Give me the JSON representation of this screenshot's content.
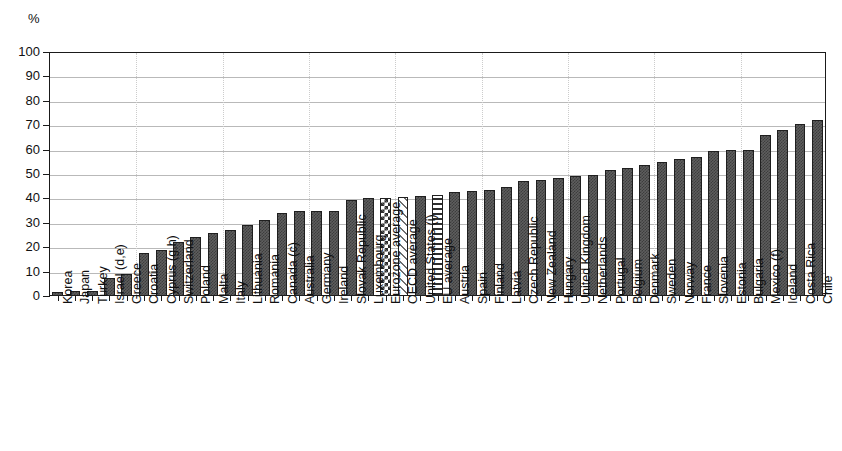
{
  "chart": {
    "unit_label": "%",
    "y_axis": {
      "ticks": [
        "0",
        "10",
        "20",
        "30",
        "40",
        "50",
        "60",
        "70",
        "80",
        "90",
        "100"
      ]
    }
  },
  "chart_data": {
    "type": "bar",
    "title": "",
    "subtitle": "",
    "xlabel": "",
    "ylabel": "%",
    "ylim": [
      0,
      100
    ],
    "ytick_step": 10,
    "grid": true,
    "legend": "none",
    "categories": [
      "Korea",
      "Japan",
      "Turkey",
      "Israel (d,e)",
      "Greece",
      "Croatia",
      "Cyprus (g,h)",
      "Switzerland",
      "Poland",
      "Malta",
      "Italy",
      "Lithuania",
      "Romania",
      "Canada (c)",
      "Australia",
      "Germany",
      "Ireland",
      "Slovak Republic",
      "Luxembourg",
      "Eurozone average",
      "OECD average",
      "United States (i)",
      "EU average",
      "Austria",
      "Spain",
      "Finland",
      "Latvia",
      "Czech Republic",
      "New Zealand",
      "Hungary",
      "United Kingdom",
      "Netherlands",
      "Portugal",
      "Belgium",
      "Denmark",
      "Sweden",
      "Norway",
      "France",
      "Slovenia",
      "Estonia",
      "Bulgaria",
      "Mexico (f)",
      "Iceland",
      "Costa Rica",
      "Chile"
    ],
    "values": [
      1.5,
      2,
      2,
      7.5,
      9,
      17.5,
      19,
      22,
      24,
      26,
      27,
      29,
      31,
      34,
      35,
      35,
      35,
      39.5,
      40,
      40,
      40.5,
      41,
      41.5,
      42.5,
      43,
      43.5,
      44.5,
      47,
      47.5,
      48.5,
      49,
      49.5,
      51.5,
      52.5,
      53.5,
      55,
      56,
      57,
      59.5,
      60,
      60,
      66,
      68,
      70.5,
      72
    ],
    "fill_patterns": [
      "solid",
      "solid",
      "solid",
      "solid",
      "solid",
      "solid",
      "solid",
      "solid",
      "solid",
      "solid",
      "solid",
      "solid",
      "solid",
      "solid",
      "solid",
      "solid",
      "solid",
      "solid",
      "solid",
      "check",
      "diag",
      "solid",
      "horiz",
      "solid",
      "solid",
      "solid",
      "solid",
      "solid",
      "solid",
      "solid",
      "solid",
      "solid",
      "solid",
      "solid",
      "solid",
      "solid",
      "solid",
      "solid",
      "solid",
      "solid",
      "solid",
      "solid",
      "solid",
      "solid",
      "solid"
    ],
    "colors": {
      "bar_fill": "#5e5e5e",
      "bar_outline": "#1f1f1f",
      "gridline": "#b9b9b9",
      "axis": "#1a1a1a",
      "background": "#ffffff"
    }
  }
}
